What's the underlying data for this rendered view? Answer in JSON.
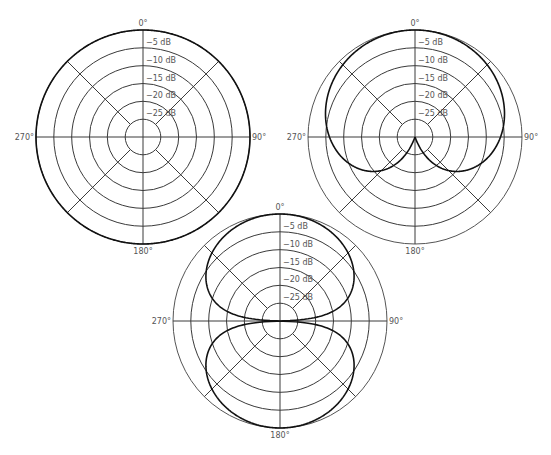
{
  "figure": {
    "ring_labels": [
      "−5 dB",
      "−10 dB",
      "−15 dB",
      "−20 dB",
      "−25 dB"
    ],
    "ring_db": [
      0,
      -5,
      -10,
      -15,
      -20,
      -25
    ],
    "min_db": -30,
    "angle_labels": {
      "top": "0°",
      "right": "90°",
      "bottom": "180°",
      "left": "270°"
    },
    "colors": {
      "grid": "#3a3a3a",
      "pattern": "#111111",
      "label": "#555555",
      "background": "#ffffff"
    }
  },
  "plots": [
    {
      "id": "omnidirectional",
      "pattern": "omni",
      "center": [
        143,
        137
      ],
      "radius": 107,
      "label_top": "0°",
      "label_right": "90°",
      "label_bottom": "180°",
      "label_left": "270°"
    },
    {
      "id": "cardioid",
      "pattern": "cardioid",
      "center": [
        415,
        137
      ],
      "radius": 107,
      "label_top": "0°",
      "label_right": "90°",
      "label_bottom": "180°",
      "label_left": "270°"
    },
    {
      "id": "figure-eight",
      "pattern": "figure8",
      "center": [
        280,
        321
      ],
      "radius": 107,
      "label_top": "0°",
      "label_right": "90°",
      "label_bottom": "180°",
      "label_left": "270°"
    }
  ]
}
